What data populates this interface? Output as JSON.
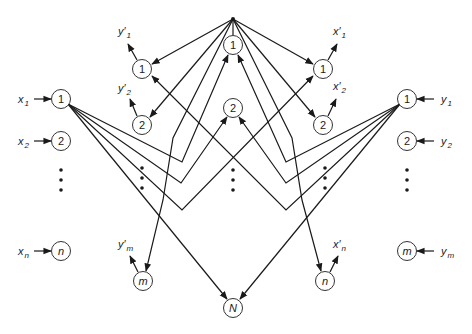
{
  "diagram": {
    "type": "neural-network",
    "apex": {
      "x": 233,
      "y": 19
    },
    "hidden_layer": {
      "nodes": [
        {
          "id": "h1",
          "label": "1",
          "x": 233,
          "y": 45
        },
        {
          "id": "h2",
          "label": "2",
          "x": 233,
          "y": 108
        },
        {
          "id": "hN",
          "label": "N",
          "x": 233,
          "y": 308,
          "italic": true
        }
      ],
      "ellipsis": true
    },
    "input_x": {
      "nodes": [
        {
          "id": "x1",
          "label": "1",
          "x": 61,
          "y": 99,
          "input": "x",
          "sub": "1"
        },
        {
          "id": "x2",
          "label": "2",
          "x": 61,
          "y": 141,
          "input": "x",
          "sub": "2"
        },
        {
          "id": "xn",
          "label": "n",
          "x": 61,
          "y": 251,
          "input": "x",
          "sub": "n",
          "italic": true
        }
      ]
    },
    "input_y": {
      "nodes": [
        {
          "id": "y1",
          "label": "1",
          "x": 407,
          "y": 99,
          "input": "y",
          "sub": "1"
        },
        {
          "id": "y2",
          "label": "2",
          "x": 407,
          "y": 141,
          "input": "y",
          "sub": "2"
        },
        {
          "id": "ym",
          "label": "m",
          "x": 407,
          "y": 251,
          "input": "y",
          "sub": "m",
          "italic": true
        }
      ]
    },
    "output_yprime": {
      "nodes": [
        {
          "id": "yp1",
          "label": "1",
          "x": 142,
          "y": 69,
          "output": "y'",
          "sub": "1"
        },
        {
          "id": "yp2",
          "label": "2",
          "x": 142,
          "y": 125,
          "output": "y'",
          "sub": "2"
        },
        {
          "id": "ypm",
          "label": "m",
          "x": 143,
          "y": 281,
          "output": "y'",
          "sub": "m",
          "italic": true
        }
      ]
    },
    "output_xprime": {
      "nodes": [
        {
          "id": "xp1",
          "label": "1",
          "x": 323,
          "y": 69,
          "output": "x'",
          "sub": "1"
        },
        {
          "id": "xp2",
          "label": "2",
          "x": 323,
          "y": 125,
          "output": "x'",
          "sub": "2"
        },
        {
          "id": "xpn",
          "label": "n",
          "x": 325,
          "y": 281,
          "output": "x'",
          "sub": "n",
          "italic": true
        }
      ]
    },
    "labels": {
      "x1": "x",
      "x1_sub": "1",
      "x2": "x",
      "x2_sub": "2",
      "xn": "x",
      "xn_sub": "n",
      "y1": "y",
      "y1_sub": "1",
      "y2": "y",
      "y2_sub": "2",
      "ym": "y",
      "ym_sub": "m",
      "yp1": "y′",
      "yp1_sub": "1",
      "yp2": "y′",
      "yp2_sub": "2",
      "ypm": "y′",
      "ypm_sub": "m",
      "xp1": "x′",
      "xp1_sub": "1",
      "xp2": "x′",
      "xp2_sub": "2",
      "xpn": "x′",
      "xpn_sub": "n"
    },
    "node_text": {
      "h1": "1",
      "h2": "2",
      "hN": "N",
      "x1": "1",
      "x2": "2",
      "xn": "n",
      "y1": "1",
      "y2": "2",
      "ym": "m",
      "yp1": "1",
      "yp2": "2",
      "ypm": "m",
      "xp1": "1",
      "xp2": "2",
      "xpn": "n"
    },
    "colors": {
      "stroke": "#1a1a1a",
      "background": "#ffffff"
    }
  }
}
